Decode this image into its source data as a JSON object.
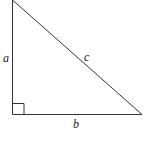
{
  "diagram": {
    "type": "right-triangle",
    "labels": {
      "vertical_leg": "a",
      "horizontal_leg": "b",
      "hypotenuse": "c"
    },
    "right_angle_marker": true,
    "colors": {
      "stroke": "#333333",
      "background": "#ffffff"
    }
  }
}
